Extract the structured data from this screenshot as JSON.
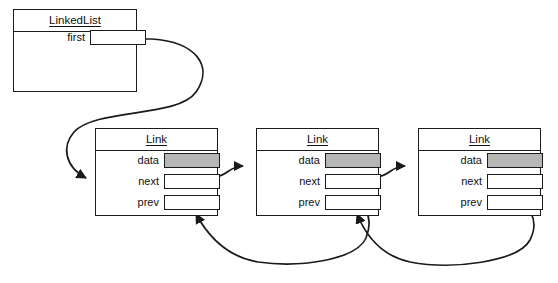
{
  "diagram": {
    "type": "object-diagram",
    "line_color": "#1a1a1a",
    "fill_color": "#ffffff",
    "data_cell_color": "#b7b7b7"
  },
  "linked_list": {
    "class_name": "LinkedList",
    "fields": [
      {
        "label": "first",
        "value": "",
        "filled": false
      }
    ]
  },
  "nodes": [
    {
      "class_name": "Link",
      "fields": [
        {
          "label": "data",
          "value": "",
          "filled": true
        },
        {
          "label": "next",
          "value": "",
          "filled": false
        },
        {
          "label": "prev",
          "value": "",
          "filled": false
        }
      ]
    },
    {
      "class_name": "Link",
      "fields": [
        {
          "label": "data",
          "value": "",
          "filled": true
        },
        {
          "label": "next",
          "value": "",
          "filled": false
        },
        {
          "label": "prev",
          "value": "",
          "filled": false
        }
      ]
    },
    {
      "class_name": "Link",
      "fields": [
        {
          "label": "data",
          "value": "",
          "filled": true
        },
        {
          "label": "next",
          "value": "",
          "filled": false
        },
        {
          "label": "prev",
          "value": "",
          "filled": false
        }
      ]
    }
  ],
  "connections": [
    {
      "name": "first-to-node1",
      "from": "linkedlist.first",
      "to": "node1",
      "style": "curved-arrow"
    },
    {
      "name": "node1-next-to-node2",
      "from": "node1.next",
      "to": "node2",
      "style": "curved-arrow"
    },
    {
      "name": "node2-next-to-node3",
      "from": "node2.next",
      "to": "node3",
      "style": "curved-arrow"
    },
    {
      "name": "node2-prev-to-node1",
      "from": "node2.prev",
      "to": "node1",
      "style": "curved-arrow"
    },
    {
      "name": "node3-prev-to-node2",
      "from": "node3.prev",
      "to": "node2",
      "style": "curved-arrow"
    }
  ]
}
